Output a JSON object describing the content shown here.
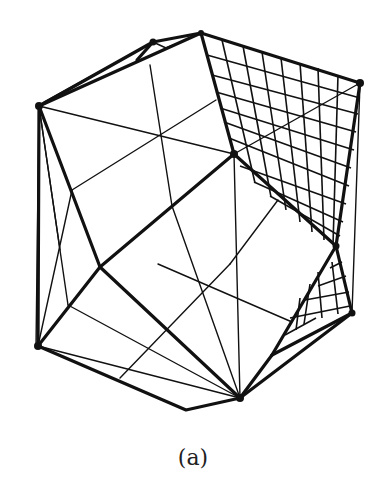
{
  "figure": {
    "caption": "(a)",
    "line_color": "#111111",
    "background": "#ffffff"
  }
}
